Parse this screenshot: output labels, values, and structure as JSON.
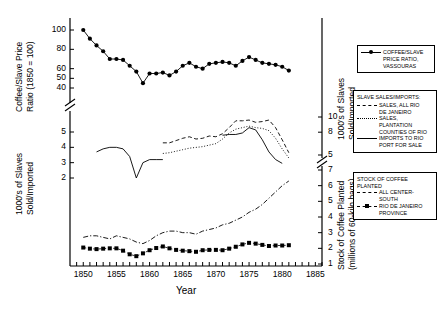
{
  "figure": {
    "xlabel": "Year",
    "left_axis_top_title": "Coffee/Slave Price\nRatio (1850 = 100)",
    "left_axis_top_line1": "Coffee/Slave Price",
    "left_axis_top_line2": "Ratio (1850 = 100)",
    "left_axis_bottom_line1": "1000's of Slaves",
    "left_axis_bottom_line2": "Sold/Imported",
    "right_axis_top_line1": "1000's of Slaves",
    "right_axis_top_line2": "Sold/Imported",
    "right_axis_bottom_line1": "Stock of Coffee Planted",
    "right_axis_bottom_line2": "(millions of 60-kilo bags)"
  },
  "axes": {
    "x_ticks_labeled": [
      "1850",
      "1855",
      "1860",
      "1865",
      "1870",
      "1875",
      "1880",
      "1885"
    ],
    "x_min": 1848,
    "x_max": 1886,
    "left_top_ticks": [
      "100",
      "80",
      "60",
      "50",
      "40"
    ],
    "left_bottom_ticks": [
      "5",
      "4",
      "3",
      "2"
    ],
    "right_top_ticks": [
      "10",
      "8",
      "5"
    ],
    "right_bottom_ticks": [
      "7",
      "6",
      "5",
      "4",
      "3",
      "2",
      "1"
    ]
  },
  "legends": {
    "legend1": {
      "rows": [
        {
          "style": "line-circle",
          "text": "COFFEE/SLAVE"
        },
        {
          "style": "none",
          "text": "PRICE RATIO,"
        },
        {
          "style": "none",
          "text": "VASSOURAS"
        }
      ]
    },
    "legend2": {
      "title": "SLAVE SALES/IMPORTS:",
      "rows": [
        {
          "style": "dash",
          "text": "SALES, ALL RIO"
        },
        {
          "style": "none",
          "text": "DE JANEIRO"
        },
        {
          "style": "dot",
          "text": "SALES,"
        },
        {
          "style": "none",
          "text": "PLANTATION"
        },
        {
          "style": "none",
          "text": "COUNTIES OF RIO"
        },
        {
          "style": "line",
          "text": "IMPORTS TO RIO"
        },
        {
          "style": "none",
          "text": "PORT FOR SALE"
        }
      ]
    },
    "legend3": {
      "title1": "STOCK OF COFFEE",
      "title2": "PLANTED",
      "rows": [
        {
          "style": "dashdot",
          "text": "ALL CENTER-"
        },
        {
          "style": "none",
          "text": "SOUTH"
        },
        {
          "style": "dash-square",
          "text": "RIO DE JANEIRO"
        },
        {
          "style": "none",
          "text": "PROVINCE"
        }
      ]
    }
  },
  "chart_data": {
    "type": "line",
    "title": "",
    "xlabel": "Year",
    "ylabel": "Coffee/Slave Price Ratio (1850 = 100); 1000's of Slaves Sold/Imported; Stock of Coffee Planted (millions of 60-kilo bags)",
    "xlim": [
      1848,
      1886
    ],
    "grid": false,
    "legend_position": "right",
    "axis_break": true,
    "panels": [
      {
        "name": "coffee-slave-price-ratio-panel",
        "ylabel": "Coffee/Slave Price Ratio (1850 = 100)",
        "ylim": [
          38,
          105
        ],
        "yticks": [
          40,
          50,
          60,
          80,
          100
        ]
      },
      {
        "name": "slaves-sold-imported-panel",
        "ylabel": "1000's of Slaves Sold/Imported",
        "ylim_left": [
          1.5,
          5.5
        ],
        "yticks_left": [
          2,
          3,
          4,
          5
        ],
        "ylim_right": [
          4,
          11
        ],
        "yticks_right": [
          5,
          8,
          10
        ]
      },
      {
        "name": "stock-of-coffee-planted-panel",
        "ylabel": "Stock of Coffee Planted (millions of 60-kilo bags)",
        "ylim_right": [
          1,
          7.5
        ],
        "yticks_right": [
          1,
          2,
          3,
          4,
          5,
          6,
          7
        ]
      }
    ],
    "series": [
      {
        "name": "COFFEE/SLAVE PRICE RATIO, VASSOURAS",
        "panel": "coffee-slave-price-ratio-panel",
        "style": "solid-with-filled-circles",
        "x": [
          1850,
          1851,
          1852,
          1853,
          1854,
          1855,
          1856,
          1857,
          1858,
          1859,
          1860,
          1861,
          1862,
          1863,
          1864,
          1865,
          1866,
          1867,
          1868,
          1869,
          1870,
          1871,
          1872,
          1873,
          1874,
          1875,
          1876,
          1877,
          1878,
          1879,
          1880,
          1881
        ],
        "values": [
          100,
          91,
          84,
          78,
          70,
          70,
          69,
          63,
          57,
          45,
          55,
          55,
          56,
          53,
          57,
          63,
          66,
          62,
          60,
          65,
          66,
          67,
          66,
          63,
          68,
          72,
          69,
          66,
          65,
          64,
          62,
          58
        ]
      },
      {
        "name": "SALES, ALL RIO DE JANEIRO",
        "panel": "slaves-sold-imported-panel",
        "style": "dashed",
        "axis": "right",
        "x": [
          1862,
          1863,
          1864,
          1865,
          1866,
          1867,
          1868,
          1869,
          1870,
          1871,
          1872,
          1873,
          1874,
          1875,
          1876,
          1877,
          1878,
          1879,
          1880,
          1881
        ],
        "values": [
          6.6,
          6.6,
          6.9,
          7.2,
          7.4,
          7.1,
          7.2,
          7.5,
          7.4,
          7.8,
          8.6,
          9.5,
          9.5,
          9.6,
          9.3,
          9.4,
          9.6,
          8.6,
          7.0,
          5.3
        ]
      },
      {
        "name": "SALES, PLANTATION COUNTIES OF RIO",
        "panel": "slaves-sold-imported-panel",
        "style": "dotted",
        "axis": "right",
        "x": [
          1862,
          1863,
          1864,
          1865,
          1866,
          1867,
          1868,
          1869,
          1870,
          1871,
          1872,
          1873,
          1874,
          1875,
          1876,
          1877,
          1878,
          1879,
          1880,
          1881
        ],
        "values": [
          5.2,
          5.3,
          5.5,
          5.7,
          5.9,
          6.0,
          6.1,
          6.3,
          6.5,
          7.1,
          7.9,
          8.4,
          8.6,
          8.8,
          8.6,
          8.5,
          8.2,
          7.2,
          5.8,
          4.6
        ]
      },
      {
        "name": "IMPORTS TO RIO PORT FOR SALE",
        "panel": "slaves-sold-imported-panel",
        "style": "solid",
        "axis": "left-and-right",
        "x": [
          1852,
          1853,
          1854,
          1855,
          1856,
          1857,
          1858,
          1859,
          1860,
          1861,
          1862,
          1871,
          1872,
          1873,
          1874,
          1875,
          1876,
          1877,
          1878,
          1879,
          1880
        ],
        "values": [
          3.7,
          3.9,
          4.0,
          4.0,
          3.9,
          3.4,
          2.0,
          3.0,
          3.2,
          3.2,
          3.2,
          7.6,
          7.7,
          7.7,
          7.9,
          8.6,
          8.3,
          7.0,
          5.4,
          4.4,
          3.9
        ]
      },
      {
        "name": "ALL CENTER-SOUTH",
        "panel": "stock-of-coffee-planted-panel",
        "style": "dash-dot",
        "axis": "right",
        "x": [
          1850,
          1851,
          1852,
          1853,
          1854,
          1855,
          1856,
          1857,
          1858,
          1859,
          1860,
          1861,
          1862,
          1863,
          1864,
          1865,
          1866,
          1867,
          1868,
          1869,
          1870,
          1871,
          1872,
          1873,
          1874,
          1875,
          1876,
          1877,
          1878,
          1879,
          1880,
          1881
        ],
        "values": [
          2.7,
          2.8,
          2.8,
          2.7,
          2.6,
          2.8,
          2.7,
          2.6,
          2.4,
          2.3,
          2.5,
          2.8,
          3.0,
          3.1,
          3.1,
          3.0,
          3.0,
          2.9,
          3.1,
          3.2,
          3.3,
          3.5,
          3.6,
          3.8,
          4.0,
          4.3,
          4.5,
          4.8,
          5.2,
          5.6,
          6.0,
          6.3
        ]
      },
      {
        "name": "RIO DE JANEIRO PROVINCE",
        "panel": "stock-of-coffee-planted-panel",
        "style": "dashed-with-filled-squares",
        "axis": "right",
        "x": [
          1850,
          1851,
          1852,
          1853,
          1854,
          1855,
          1856,
          1857,
          1858,
          1859,
          1860,
          1861,
          1862,
          1863,
          1864,
          1865,
          1866,
          1867,
          1868,
          1869,
          1870,
          1871,
          1872,
          1873,
          1874,
          1875,
          1876,
          1877,
          1878,
          1879,
          1880,
          1881
        ],
        "values": [
          2.05,
          1.98,
          1.95,
          1.98,
          2.0,
          2.0,
          1.85,
          1.62,
          1.5,
          1.68,
          1.88,
          2.02,
          2.12,
          2.0,
          1.9,
          1.85,
          1.82,
          1.78,
          1.88,
          1.9,
          1.9,
          1.88,
          1.98,
          2.1,
          2.25,
          2.35,
          2.3,
          2.22,
          2.15,
          2.18,
          2.18,
          2.2
        ]
      }
    ]
  }
}
